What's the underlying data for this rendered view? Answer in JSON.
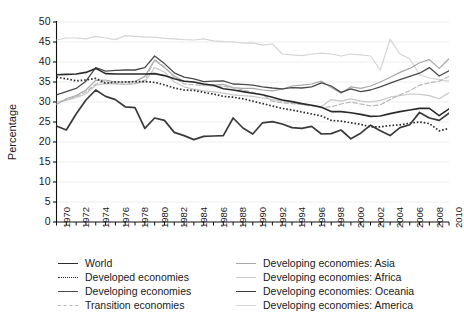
{
  "axis": {
    "ylabel": "Percentage",
    "yticks": [
      0,
      5,
      10,
      15,
      20,
      25,
      30,
      35,
      40,
      45,
      50
    ],
    "ylim": [
      0,
      50
    ],
    "xlim": [
      1970,
      2010
    ],
    "xticks": [
      1970,
      1972,
      1974,
      1976,
      1978,
      1980,
      1982,
      1984,
      1986,
      1988,
      1990,
      1992,
      1994,
      1996,
      1998,
      2000,
      2002,
      2004,
      2006,
      2008,
      2010
    ]
  },
  "legend": {
    "left": [
      {
        "label": "World",
        "style": "solid",
        "color": "#2b2b2b",
        "width": 1.6
      },
      {
        "label": "Developed economies",
        "style": "dotted",
        "color": "#2b2b2b",
        "width": 1.6
      },
      {
        "label": "Developing economies",
        "style": "solid",
        "color": "#4a4a4a",
        "width": 1.3
      },
      {
        "label": "Transition economies",
        "style": "dashed",
        "color": "#b8b8b8",
        "width": 1.2
      }
    ],
    "right": [
      {
        "label": "Developing economies: Asia",
        "style": "solid",
        "color": "#a8a8a8",
        "width": 1.2
      },
      {
        "label": "Developing economies: Africa",
        "style": "solid",
        "color": "#c9c9c9",
        "width": 1.2
      },
      {
        "label": "Developing economies: Oceania",
        "style": "solid",
        "color": "#3a3a3a",
        "width": 1.7
      },
      {
        "label": "Developing economies: America",
        "style": "solid",
        "color": "#d5d5d5",
        "width": 1.2
      }
    ]
  },
  "chart_data": {
    "type": "line",
    "title": "",
    "xlabel": "",
    "ylabel": "Percentage",
    "xlim": [
      1970,
      2010
    ],
    "ylim": [
      0,
      50
    ],
    "grid": true,
    "legend_position": "below",
    "x": [
      1970,
      1971,
      1972,
      1973,
      1974,
      1975,
      1976,
      1977,
      1978,
      1979,
      1980,
      1981,
      1982,
      1983,
      1984,
      1985,
      1986,
      1987,
      1988,
      1989,
      1990,
      1991,
      1992,
      1993,
      1994,
      1995,
      1996,
      1997,
      1998,
      1999,
      2000,
      2001,
      2002,
      2003,
      2004,
      2005,
      2006,
      2007,
      2008,
      2009,
      2010
    ],
    "series": [
      {
        "name": "World",
        "color": "#2b2b2b",
        "style": "solid",
        "width": 1.6,
        "values": [
          36.8,
          36.9,
          37.0,
          37.4,
          38.4,
          37.1,
          37.0,
          37.0,
          37.0,
          37.0,
          37.1,
          36.6,
          35.8,
          35.2,
          35.0,
          34.5,
          34.2,
          33.3,
          33.0,
          32.6,
          32.2,
          31.8,
          31.2,
          30.5,
          30.1,
          29.6,
          29.2,
          28.7,
          27.6,
          27.6,
          27.3,
          26.9,
          26.4,
          26.5,
          27.1,
          27.6,
          28.0,
          28.4,
          28.4,
          26.6,
          28.3
        ]
      },
      {
        "name": "Developed economies",
        "color": "#2b2b2b",
        "style": "dotted",
        "width": 1.7,
        "values": [
          36.2,
          35.8,
          35.3,
          35.5,
          35.9,
          34.7,
          35.0,
          35.0,
          35.1,
          35.1,
          34.9,
          34.3,
          33.5,
          33.0,
          32.9,
          32.4,
          32.0,
          31.4,
          31.2,
          30.8,
          30.2,
          29.6,
          29.0,
          28.4,
          28.0,
          27.5,
          27.0,
          26.5,
          25.4,
          25.2,
          24.8,
          24.4,
          23.8,
          23.8,
          24.1,
          24.3,
          24.7,
          25.0,
          24.6,
          22.8,
          23.4
        ]
      },
      {
        "name": "Developing economies",
        "color": "#4a4a4a",
        "style": "solid",
        "width": 1.3,
        "values": [
          31.8,
          32.6,
          33.4,
          35.2,
          38.6,
          37.7,
          37.9,
          38.0,
          38.0,
          38.6,
          41.5,
          39.6,
          37.3,
          36.2,
          35.8,
          35.1,
          35.2,
          35.3,
          34.5,
          34.4,
          34.2,
          33.8,
          33.5,
          33.3,
          33.6,
          33.5,
          33.8,
          34.8,
          34.0,
          32.4,
          33.3,
          32.6,
          33.0,
          33.8,
          34.7,
          35.6,
          36.4,
          37.2,
          38.6,
          36.5,
          37.8
        ]
      },
      {
        "name": "Transition economies",
        "color": "#b8b8b8",
        "style": "dashed",
        "width": 1.2,
        "values": [
          29.5,
          30.6,
          31.4,
          32.5,
          34.5,
          35.2,
          34.6,
          34.5,
          34.6,
          35.4,
          40.6,
          38.8,
          36.2,
          34.5,
          34.3,
          34.1,
          34.0,
          33.9,
          33.5,
          33.0,
          32.4,
          31.8,
          30.2,
          29.8,
          29.6,
          29.4,
          29.0,
          28.6,
          28.8,
          29.5,
          30.0,
          29.5,
          29.0,
          29.3,
          30.6,
          31.8,
          32.8,
          34.2,
          34.8,
          35.2,
          36.4
        ]
      },
      {
        "name": "Developing economies: Asia",
        "color": "#a8a8a8",
        "style": "solid",
        "width": 1.2,
        "values": [
          29.4,
          30.8,
          31.6,
          33.0,
          35.4,
          35.5,
          35.0,
          35.0,
          35.1,
          36.4,
          40.5,
          38.6,
          36.5,
          35.2,
          35.0,
          34.3,
          34.2,
          34.4,
          33.6,
          33.4,
          33.4,
          33.0,
          32.8,
          33.2,
          34.0,
          34.2,
          34.5,
          35.2,
          33.6,
          32.2,
          33.8,
          33.4,
          34.0,
          35.0,
          36.2,
          37.4,
          38.4,
          39.8,
          40.6,
          38.4,
          40.8
        ]
      },
      {
        "name": "Developing economies: Africa",
        "color": "#c9c9c9",
        "style": "solid",
        "width": 1.2,
        "values": [
          30.0,
          30.4,
          31.1,
          32.0,
          34.2,
          34.6,
          34.5,
          34.4,
          34.6,
          35.0,
          38.6,
          37.5,
          35.0,
          33.8,
          33.2,
          32.8,
          32.6,
          32.2,
          31.8,
          31.6,
          31.4,
          31.0,
          30.6,
          30.2,
          29.8,
          29.4,
          29.2,
          28.9,
          30.6,
          30.2,
          30.8,
          30.2,
          30.0,
          30.4,
          31.2,
          31.6,
          32.0,
          31.9,
          31.6,
          30.8,
          32.3
        ]
      },
      {
        "name": "Developing economies: Oceania",
        "color": "#3a3a3a",
        "style": "solid",
        "width": 1.7,
        "values": [
          24.0,
          23.0,
          27.0,
          30.5,
          33.0,
          31.4,
          30.6,
          28.8,
          28.6,
          23.4,
          26.0,
          25.4,
          22.4,
          21.6,
          20.6,
          21.4,
          21.5,
          21.6,
          26.0,
          23.5,
          22.0,
          24.8,
          25.1,
          24.5,
          23.6,
          23.4,
          23.9,
          22.0,
          22.1,
          23.0,
          20.8,
          22.2,
          24.2,
          22.8,
          21.6,
          23.6,
          24.3,
          27.4,
          26.0,
          25.4,
          27.2
        ]
      },
      {
        "name": "Developing economies: America",
        "color": "#d5d5d5",
        "style": "solid",
        "width": 1.2,
        "values": [
          45.5,
          46.0,
          46.0,
          45.8,
          46.4,
          46.0,
          45.6,
          46.6,
          46.4,
          46.2,
          46.2,
          45.9,
          45.8,
          45.6,
          45.5,
          45.8,
          45.3,
          45.1,
          45.0,
          44.7,
          44.8,
          44.2,
          44.5,
          42.0,
          41.8,
          41.6,
          42.0,
          42.2,
          42.0,
          41.5,
          42.0,
          41.8,
          41.5,
          38.0,
          45.7,
          42.0,
          40.8,
          36.8,
          36.0,
          35.6,
          35.2
        ]
      }
    ]
  }
}
